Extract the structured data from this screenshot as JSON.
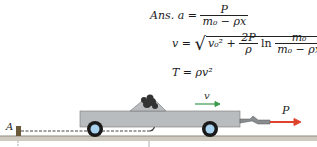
{
  "equations": {
    "ans_label": "Ans.",
    "eq1": {
      "lhs": "a",
      "num": "P",
      "den": "m₀ − ρx"
    },
    "eq2": {
      "lhs": "v",
      "term1": "v₀²",
      "plus": "+",
      "coef_num": "2P",
      "coef_den": "ρ",
      "ln": "ln",
      "num": "m₀",
      "den": "m₀ − ρx"
    },
    "eq3": {
      "lhs": "T",
      "rhs": "ρv²"
    }
  },
  "diagram": {
    "point_label": "A",
    "velocity_label": "v",
    "force_label": "P",
    "colors": {
      "truck_body": "#b9bcbf",
      "ground": "#cfcabf",
      "velocity_arrow": "#3a9a4a",
      "force_arrow": "#e0432b",
      "chain": "#444444"
    }
  }
}
